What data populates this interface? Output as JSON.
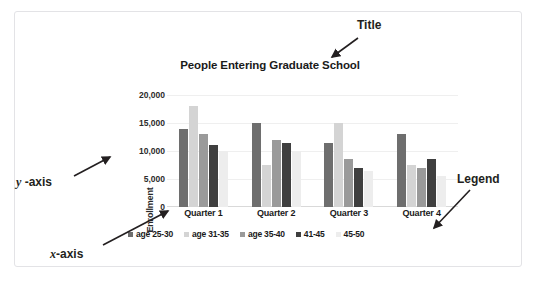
{
  "figure": {
    "top_cut_text": "·      ·   ·        ·     ·  ·",
    "annotations": {
      "title": "Title",
      "y_axis": "y",
      "y_axis_suffix": " -axis",
      "x_axis": "x",
      "x_axis_suffix": "-axis",
      "legend": "Legend"
    }
  },
  "chart_data": {
    "type": "bar",
    "title": "People Entering Graduate School",
    "xlabel": "",
    "ylabel": "Enrollment",
    "categories": [
      "Quarter 1",
      "Quarter 2",
      "Quarter 3",
      "Quarter 4"
    ],
    "series": [
      {
        "name": "age 25-30",
        "color": "#6e6e6e",
        "values": [
          14000,
          15000,
          11500,
          13000
        ]
      },
      {
        "name": "age 31-35",
        "color": "#d4d4d4",
        "values": [
          18000,
          7500,
          15000,
          7500
        ]
      },
      {
        "name": "age 35-40",
        "color": "#9a9a9a",
        "values": [
          13000,
          12000,
          8500,
          7000
        ]
      },
      {
        "name": "41-45",
        "color": "#3f3f3f",
        "values": [
          11000,
          11500,
          7000,
          8500
        ]
      },
      {
        "name": "45-50",
        "color": "#ededed",
        "values": [
          10000,
          10000,
          6500,
          5500
        ]
      }
    ],
    "ylim": [
      0,
      20000
    ],
    "yticks": [
      "0",
      "5,000",
      "10,000",
      "15,000",
      "20,000"
    ],
    "ytick_values": [
      0,
      5000,
      10000,
      15000,
      20000
    ],
    "grid": true,
    "legend_position": "bottom"
  }
}
